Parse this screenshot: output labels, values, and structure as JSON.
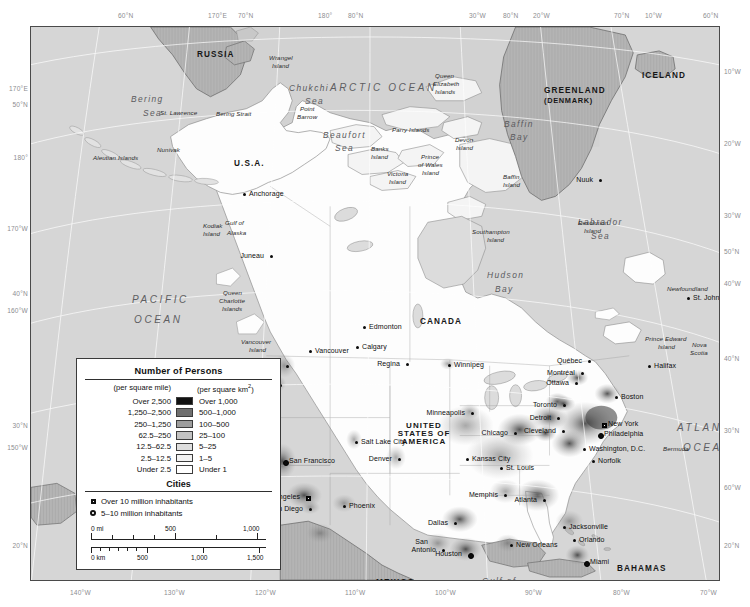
{
  "graticule": {
    "top": [
      {
        "text": "60°N",
        "x": 118
      },
      {
        "text": "170°E",
        "x": 208
      },
      {
        "text": "70°N",
        "x": 238
      },
      {
        "text": "180°",
        "x": 318
      },
      {
        "text": "80°N",
        "x": 348
      },
      {
        "text": "30°W",
        "x": 469
      },
      {
        "text": "80°N",
        "x": 503
      },
      {
        "text": "20°W",
        "x": 533
      },
      {
        "text": "70°N",
        "x": 614
      },
      {
        "text": "10°W",
        "x": 645
      },
      {
        "text": "60°N",
        "x": 703
      }
    ],
    "bottom": [
      {
        "text": "140°W",
        "x": 70
      },
      {
        "text": "130°W",
        "x": 164
      },
      {
        "text": "120°W",
        "x": 255
      },
      {
        "text": "110°W",
        "x": 345
      },
      {
        "text": "100°W",
        "x": 435
      },
      {
        "text": "90°W",
        "x": 525
      },
      {
        "text": "80°W",
        "x": 613
      },
      {
        "text": "70°W",
        "x": 700
      }
    ],
    "left": [
      {
        "text": "170°E",
        "y": 59
      },
      {
        "text": "50°N",
        "y": 75
      },
      {
        "text": "180°",
        "y": 128
      },
      {
        "text": "170°W",
        "y": 199
      },
      {
        "text": "40°N",
        "y": 264
      },
      {
        "text": "160°W",
        "y": 281
      },
      {
        "text": "30°N",
        "y": 396
      },
      {
        "text": "150°W",
        "y": 418
      },
      {
        "text": "20°N",
        "y": 516
      }
    ],
    "right": [
      {
        "text": "10°W",
        "y": 42
      },
      {
        "text": "20°W",
        "y": 114
      },
      {
        "text": "30°W",
        "y": 186
      },
      {
        "text": "50°N",
        "y": 222
      },
      {
        "text": "40°W",
        "y": 254
      },
      {
        "text": "40°N",
        "y": 329
      },
      {
        "text": "30°N",
        "y": 401
      },
      {
        "text": "60°W",
        "y": 458
      },
      {
        "text": "20°N",
        "y": 516
      }
    ]
  },
  "legend": {
    "title": "Number of Persons",
    "col_mile": "(per square mile)",
    "col_km": "(per square km2)",
    "km_sup": "2",
    "rows": [
      {
        "mile": "Over 2,500",
        "km": "Over 1,000",
        "color": "#111111"
      },
      {
        "mile": "1,250–2,500",
        "km": "500–1,000",
        "color": "#6f6f6f"
      },
      {
        "mile": "250–1,250",
        "km": "100–500",
        "color": "#9d9d9d"
      },
      {
        "mile": "62.5–250",
        "km": "25–100",
        "color": "#c2c2c2"
      },
      {
        "mile": "12.5–62.5",
        "km": "5–25",
        "color": "#dedede"
      },
      {
        "mile": "2.5–12.5",
        "km": "1–5",
        "color": "#f2f2f2"
      },
      {
        "mile": "Under 2.5",
        "km": "Under 1",
        "color": "#ffffff"
      }
    ],
    "cities_title": "Cities",
    "cities": [
      {
        "marker": "square",
        "label": "Over 10 million inhabitants"
      },
      {
        "marker": "circle",
        "label": "5–10 million inhabitants"
      }
    ],
    "scale": {
      "mi_unit": "0 mi",
      "mi_ticks": [
        "500",
        "1,000"
      ],
      "km_unit": "0 km",
      "km_ticks": [
        "500",
        "1,000",
        "1,500"
      ]
    }
  },
  "countries": [
    {
      "name": "RUSSIA",
      "x": 166,
      "y": 24,
      "cls": "country"
    },
    {
      "name": "U.S.A.",
      "x": 203,
      "y": 133,
      "cls": "country"
    },
    {
      "name": "CANADA",
      "x": 389,
      "y": 291,
      "cls": "country"
    },
    {
      "name": "GREENLAND",
      "x": 513,
      "y": 60,
      "cls": "country"
    },
    {
      "name": "(DENMARK)",
      "x": 513,
      "y": 70,
      "cls": "country sm"
    },
    {
      "name": "ICELAND",
      "x": 611,
      "y": 45,
      "cls": "country"
    },
    {
      "name": "MEXICO",
      "x": 345,
      "y": 552,
      "cls": "country"
    },
    {
      "name": "BAHAMAS",
      "x": 586,
      "y": 538,
      "cls": "country"
    },
    {
      "name": "CUBA",
      "x": 564,
      "y": 571,
      "cls": "country"
    }
  ],
  "usa_block": [
    "UNITED",
    "STATES OF",
    "AMERICA"
  ],
  "oceans": [
    {
      "name": "ARCTIC OCEAN",
      "x": 299,
      "y": 56,
      "cls": "ocean"
    },
    {
      "name": "PACIFIC",
      "x": 101,
      "y": 268,
      "cls": "ocean"
    },
    {
      "name": "OCEAN",
      "x": 103,
      "y": 288,
      "cls": "ocean"
    },
    {
      "name": "ATLANTIC",
      "x": 646,
      "y": 396,
      "cls": "ocean"
    },
    {
      "name": "OCEAN",
      "x": 652,
      "y": 416,
      "cls": "ocean"
    }
  ],
  "seas": [
    {
      "name": "Bering",
      "x": 100,
      "y": 68
    },
    {
      "name": "Sea",
      "x": 112,
      "y": 82
    },
    {
      "name": "Chukchi",
      "x": 258,
      "y": 57
    },
    {
      "name": "Sea",
      "x": 274,
      "y": 70
    },
    {
      "name": "Beaufort",
      "x": 292,
      "y": 104
    },
    {
      "name": "Sea",
      "x": 304,
      "y": 117
    },
    {
      "name": "Baffin",
      "x": 473,
      "y": 93
    },
    {
      "name": "Bay",
      "x": 479,
      "y": 106
    },
    {
      "name": "Hudson",
      "x": 456,
      "y": 244
    },
    {
      "name": "Bay",
      "x": 464,
      "y": 258
    },
    {
      "name": "Labrador",
      "x": 547,
      "y": 191
    },
    {
      "name": "Sea",
      "x": 560,
      "y": 205
    },
    {
      "name": "Gulf of",
      "x": 451,
      "y": 550
    },
    {
      "name": "Mexico",
      "x": 453,
      "y": 563
    }
  ],
  "islands": [
    {
      "name": "Wrangel",
      "x": 238,
      "y": 28
    },
    {
      "name": "Island",
      "x": 241,
      "y": 36
    },
    {
      "name": "St. Lawrence",
      "x": 129,
      "y": 83
    },
    {
      "name": "Bering Strait",
      "x": 185,
      "y": 84
    },
    {
      "name": "Point",
      "x": 269,
      "y": 79
    },
    {
      "name": "Barrow",
      "x": 266,
      "y": 87
    },
    {
      "name": "Nunivak",
      "x": 126,
      "y": 120
    },
    {
      "name": "Aleutian Islands",
      "x": 62,
      "y": 128
    },
    {
      "name": "Kodiak",
      "x": 172,
      "y": 196
    },
    {
      "name": "Island",
      "x": 172,
      "y": 204
    },
    {
      "name": "Gulf of",
      "x": 194,
      "y": 193
    },
    {
      "name": "Alaska",
      "x": 196,
      "y": 203
    },
    {
      "name": "Queen",
      "x": 404,
      "y": 46
    },
    {
      "name": "Elizabeth",
      "x": 402,
      "y": 54
    },
    {
      "name": "Islands",
      "x": 404,
      "y": 62
    },
    {
      "name": "Parry Islands",
      "x": 361,
      "y": 100
    },
    {
      "name": "Banks",
      "x": 340,
      "y": 119
    },
    {
      "name": "Island",
      "x": 340,
      "y": 127
    },
    {
      "name": "Devon",
      "x": 424,
      "y": 110
    },
    {
      "name": "Island",
      "x": 425,
      "y": 118
    },
    {
      "name": "Prince",
      "x": 390,
      "y": 127
    },
    {
      "name": "of Wales",
      "x": 387,
      "y": 135
    },
    {
      "name": "Island",
      "x": 391,
      "y": 143
    },
    {
      "name": "Victoria",
      "x": 356,
      "y": 144
    },
    {
      "name": "Island",
      "x": 358,
      "y": 152
    },
    {
      "name": "Baffin",
      "x": 472,
      "y": 147
    },
    {
      "name": "Island",
      "x": 472,
      "y": 155
    },
    {
      "name": "Southampton",
      "x": 441,
      "y": 202
    },
    {
      "name": "Island",
      "x": 456,
      "y": 210
    },
    {
      "name": "Resolution",
      "x": 547,
      "y": 193
    },
    {
      "name": "Island",
      "x": 553,
      "y": 201
    },
    {
      "name": "Queen",
      "x": 192,
      "y": 263
    },
    {
      "name": "Charlotte",
      "x": 188,
      "y": 271
    },
    {
      "name": "Islands",
      "x": 191,
      "y": 279
    },
    {
      "name": "Vancouver",
      "x": 210,
      "y": 312
    },
    {
      "name": "Island",
      "x": 218,
      "y": 320
    },
    {
      "name": "Newfoundland",
      "x": 636,
      "y": 259
    },
    {
      "name": "Prince Edward",
      "x": 614,
      "y": 309
    },
    {
      "name": "Island",
      "x": 627,
      "y": 317
    },
    {
      "name": "Nova",
      "x": 661,
      "y": 315
    },
    {
      "name": "Scotia",
      "x": 659,
      "y": 323
    },
    {
      "name": "Bermuda",
      "x": 632,
      "y": 419
    }
  ],
  "cities": [
    {
      "name": "Anchorage",
      "x": 213,
      "y": 167,
      "dx": -7,
      "dy": 0,
      "mk": "dot",
      "anchor": "left"
    },
    {
      "name": "Juneau",
      "x": 240,
      "y": 229,
      "dx": 0,
      "dy": 0,
      "mk": "dot",
      "anchor": "right"
    },
    {
      "name": "Nuuk",
      "x": 569,
      "y": 153,
      "dx": 0,
      "dy": 0,
      "mk": "dot",
      "anchor": "right"
    },
    {
      "name": "Vancouver",
      "x": 279,
      "y": 324,
      "dx": 0,
      "dy": 0,
      "mk": "dot",
      "anchor": "left"
    },
    {
      "name": "Seattle",
      "x": 256,
      "y": 339,
      "dx": 0,
      "dy": 0,
      "mk": "dot",
      "anchor": "right"
    },
    {
      "name": "Portland",
      "x": 249,
      "y": 358,
      "dx": 0,
      "dy": 0,
      "mk": "dot",
      "anchor": "right"
    },
    {
      "name": "Edmonton",
      "x": 333,
      "y": 300,
      "dx": 0,
      "dy": 0,
      "mk": "dot",
      "anchor": "left"
    },
    {
      "name": "Calgary",
      "x": 326,
      "y": 320,
      "dx": 0,
      "dy": 0,
      "mk": "dot",
      "anchor": "left"
    },
    {
      "name": "Regina",
      "x": 376,
      "y": 337,
      "dx": 0,
      "dy": 0,
      "mk": "dot",
      "anchor": "right"
    },
    {
      "name": "Winnipeg",
      "x": 418,
      "y": 338,
      "dx": 0,
      "dy": 0,
      "mk": "dot",
      "anchor": "left"
    },
    {
      "name": "Minneapolis",
      "x": 441,
      "y": 386,
      "dx": 0,
      "dy": 0,
      "mk": "dot",
      "anchor": "right"
    },
    {
      "name": "Chicago",
      "x": 484,
      "y": 406,
      "dx": 0,
      "dy": 0,
      "mk": "dot",
      "anchor": "right"
    },
    {
      "name": "Detroit",
      "x": 527,
      "y": 391,
      "dx": 0,
      "dy": 0,
      "mk": "dot",
      "anchor": "right"
    },
    {
      "name": "Toronto",
      "x": 533,
      "y": 378,
      "dx": 0,
      "dy": 0,
      "mk": "dot",
      "anchor": "right"
    },
    {
      "name": "Cleveland",
      "x": 532,
      "y": 404,
      "dx": 0,
      "dy": 0,
      "mk": "dot",
      "anchor": "right"
    },
    {
      "name": "Boston",
      "x": 585,
      "y": 370,
      "dx": 0,
      "dy": 0,
      "mk": "dot",
      "anchor": "left"
    },
    {
      "name": "New York",
      "x": 572,
      "y": 397,
      "dx": 0,
      "dy": 0,
      "mk": "square",
      "anchor": "left"
    },
    {
      "name": "Philadelphia",
      "x": 568,
      "y": 407,
      "dx": 0,
      "dy": 0,
      "mk": "circle",
      "anchor": "left"
    },
    {
      "name": "Washington, D.C.",
      "x": 553,
      "y": 422,
      "dx": 0,
      "dy": 0,
      "mk": "dot",
      "anchor": "left"
    },
    {
      "name": "Norfolk",
      "x": 562,
      "y": 434,
      "dx": 0,
      "dy": 0,
      "mk": "dot",
      "anchor": "left"
    },
    {
      "name": "Ottawa",
      "x": 545,
      "y": 356,
      "dx": 0,
      "dy": 0,
      "mk": "dot",
      "anchor": "right"
    },
    {
      "name": "Montréal",
      "x": 551,
      "y": 346,
      "dx": 0,
      "dy": 0,
      "mk": "dot",
      "anchor": "right"
    },
    {
      "name": "Québec",
      "x": 558,
      "y": 334,
      "dx": 0,
      "dy": 0,
      "mk": "dot",
      "anchor": "right"
    },
    {
      "name": "Halifax",
      "x": 618,
      "y": 339,
      "dx": 0,
      "dy": 0,
      "mk": "dot",
      "anchor": "left"
    },
    {
      "name": "St. John's",
      "x": 657,
      "y": 271,
      "dx": 0,
      "dy": 0,
      "mk": "dot",
      "anchor": "left"
    },
    {
      "name": "San Francisco",
      "x": 253,
      "y": 434,
      "dx": 0,
      "dy": 0,
      "mk": "circle",
      "anchor": "left"
    },
    {
      "name": "Salt Lake City",
      "x": 325,
      "y": 415,
      "dx": 0,
      "dy": 0,
      "mk": "dot",
      "anchor": "left"
    },
    {
      "name": "Denver",
      "x": 368,
      "y": 432,
      "dx": 0,
      "dy": 0,
      "mk": "dot",
      "anchor": "right"
    },
    {
      "name": "Kansas City",
      "x": 436,
      "y": 432,
      "dx": 0,
      "dy": 0,
      "mk": "dot",
      "anchor": "left"
    },
    {
      "name": "St. Louis",
      "x": 470,
      "y": 441,
      "dx": 0,
      "dy": 0,
      "mk": "dot",
      "anchor": "left"
    },
    {
      "name": "Los Angeles",
      "x": 276,
      "y": 470,
      "dx": 0,
      "dy": 0,
      "mk": "square",
      "anchor": "right"
    },
    {
      "name": "San Diego",
      "x": 279,
      "y": 482,
      "dx": 0,
      "dy": 0,
      "mk": "dot",
      "anchor": "right"
    },
    {
      "name": "Phoenix",
      "x": 313,
      "y": 479,
      "dx": 0,
      "dy": 0,
      "mk": "dot",
      "anchor": "left"
    },
    {
      "name": "Memphis",
      "x": 474,
      "y": 468,
      "dx": 0,
      "dy": 0,
      "mk": "dot",
      "anchor": "right"
    },
    {
      "name": "Atlanta",
      "x": 513,
      "y": 473,
      "dx": 0,
      "dy": 0,
      "mk": "dot",
      "anchor": "right"
    },
    {
      "name": "Dallas",
      "x": 424,
      "y": 496,
      "dx": 0,
      "dy": 0,
      "mk": "dot",
      "anchor": "right"
    },
    {
      "name": "San",
      "x": 404,
      "y": 515,
      "dx": 0,
      "dy": 0,
      "mk": "none",
      "anchor": "right"
    },
    {
      "name": "Antonio",
      "x": 412,
      "y": 523,
      "dx": 0,
      "dy": 0,
      "mk": "dot",
      "anchor": "right"
    },
    {
      "name": "Houston",
      "x": 438,
      "y": 527,
      "dx": 0,
      "dy": 0,
      "mk": "circle",
      "anchor": "right"
    },
    {
      "name": "New Orleans",
      "x": 480,
      "y": 518,
      "dx": 0,
      "dy": 0,
      "mk": "dot",
      "anchor": "left"
    },
    {
      "name": "Jacksonville",
      "x": 533,
      "y": 500,
      "dx": 0,
      "dy": 0,
      "mk": "dot",
      "anchor": "left"
    },
    {
      "name": "Orlando",
      "x": 543,
      "y": 513,
      "dx": 0,
      "dy": 0,
      "mk": "dot",
      "anchor": "left"
    },
    {
      "name": "Miami",
      "x": 554,
      "y": 535,
      "dx": 0,
      "dy": 0,
      "mk": "circle",
      "anchor": "left"
    }
  ]
}
